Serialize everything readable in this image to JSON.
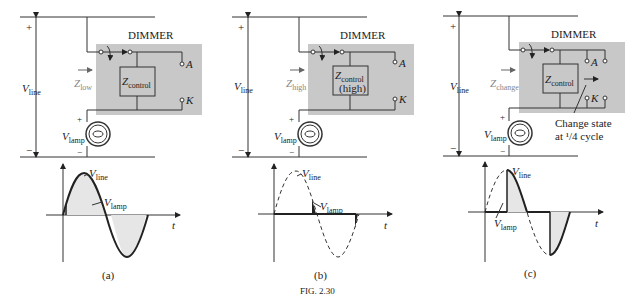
{
  "panels": [
    {
      "id": "a",
      "caption": "(a)",
      "dimmer_label": "DIMMER",
      "impedance_label": "Z",
      "impedance_sub": "low",
      "control_label": "Z",
      "control_sub": "control",
      "control_extra": "",
      "terminal_a": "A",
      "terminal_k": "K",
      "v_line": "V",
      "v_line_sub": "line",
      "v_lamp": "V",
      "v_lamp_sub": "lamp",
      "plus": "+",
      "minus": "−",
      "wave_line_label": "V",
      "wave_line_sub": "line",
      "wave_lamp_label": "V",
      "wave_lamp_sub": "lamp",
      "t_label": "t"
    },
    {
      "id": "b",
      "caption": "(b)",
      "dimmer_label": "DIMMER",
      "impedance_label": "Z",
      "impedance_sub": "high",
      "control_label": "Z",
      "control_sub": "control",
      "control_extra": "(high)",
      "terminal_a": "A",
      "terminal_k": "K",
      "v_line": "V",
      "v_line_sub": "line",
      "v_lamp": "V",
      "v_lamp_sub": "lamp",
      "plus": "+",
      "minus": "−",
      "wave_line_label": "V",
      "wave_line_sub": "line",
      "wave_lamp_label": "V",
      "wave_lamp_sub": "lamp",
      "t_label": "t"
    },
    {
      "id": "c",
      "caption": "(c)",
      "dimmer_label": "DIMMER",
      "impedance_label": "Z",
      "impedance_sub": "change",
      "control_label": "Z",
      "control_sub": "control",
      "control_extra": "",
      "terminal_a": "A",
      "terminal_k": "K",
      "v_line": "V",
      "v_line_sub": "line",
      "v_lamp": "V",
      "v_lamp_sub": "lamp",
      "plus": "+",
      "minus": "−",
      "wave_line_label": "V",
      "wave_line_sub": "line",
      "wave_lamp_label": "V",
      "wave_lamp_sub": "lamp",
      "t_label": "t",
      "annotation_line1": "Change state",
      "annotation_line2": "at ¹/4 cycle"
    }
  ],
  "figure_caption": "FIG. 2.30",
  "colors": {
    "dimmer_box": "#c8c8c8",
    "fill": "#e6e6e6",
    "line": "#222222",
    "gray_text": "#888888"
  }
}
